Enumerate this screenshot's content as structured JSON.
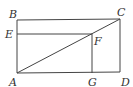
{
  "diagram": {
    "title": "",
    "points": {
      "A": {
        "label": "A",
        "x": 17,
        "y": 73
      },
      "B": {
        "label": "B",
        "x": 17,
        "y": 20
      },
      "C": {
        "label": "C",
        "x": 120,
        "y": 19
      },
      "D": {
        "label": "D",
        "x": 120,
        "y": 72
      },
      "E": {
        "label": "E",
        "x": 17,
        "y": 34
      },
      "F": {
        "label": "F",
        "x": 92,
        "y": 34
      },
      "G": {
        "label": "G",
        "x": 92,
        "y": 73
      }
    },
    "segments": [
      "AB",
      "BC",
      "CD",
      "DA",
      "AC",
      "EF",
      "FG"
    ],
    "colors": {
      "line": "#444444",
      "text": "#333333",
      "background": "#ffffff"
    }
  }
}
